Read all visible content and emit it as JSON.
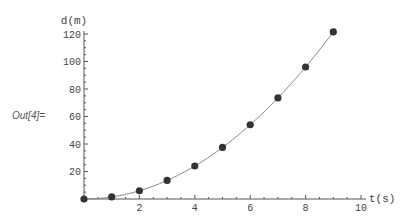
{
  "cell": {
    "output_label": "Out[4]="
  },
  "chart_data": {
    "type": "scatter",
    "title": "",
    "xlabel": "t(s)",
    "ylabel": "d(m)",
    "xlim": [
      0,
      10
    ],
    "ylim": [
      0,
      120
    ],
    "xticks": [
      2,
      4,
      6,
      8,
      10
    ],
    "yticks": [
      20,
      40,
      60,
      80,
      100,
      120
    ],
    "x_minor_step": 0.5,
    "y_minor_step": 5,
    "grid": false,
    "series": [
      {
        "name": "measured",
        "x": [
          0,
          1,
          2,
          3,
          4,
          5,
          6,
          7,
          8,
          9
        ],
        "y": [
          0,
          1.5,
          6,
          13.5,
          24,
          37.5,
          54,
          73.5,
          96,
          121.5
        ],
        "marker": "circle",
        "color": "#333333"
      },
      {
        "name": "fit",
        "type": "line",
        "formula": "d = 1.5 t^2",
        "coefficient": 1.5,
        "x_range": [
          0,
          9.1
        ],
        "color": "#888888"
      }
    ]
  }
}
